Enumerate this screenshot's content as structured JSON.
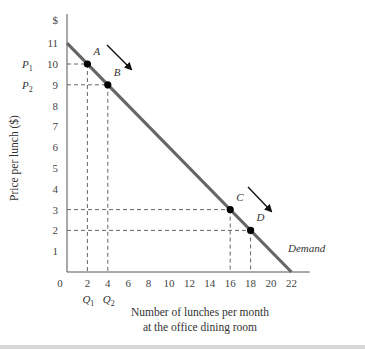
{
  "chart_data": {
    "type": "line",
    "title": "",
    "xlabel": "Number of lunches per month at the office dining room",
    "xlabel_lines": [
      "Number of lunches per month",
      "at the office dining room"
    ],
    "ylabel": "Price per lunch ($)",
    "y_unit_label": "$",
    "xlim": [
      0,
      22
    ],
    "ylim": [
      0,
      11
    ],
    "x_ticks": [
      0,
      2,
      4,
      6,
      8,
      10,
      12,
      14,
      16,
      18,
      20,
      22
    ],
    "y_ticks": [
      1,
      2,
      3,
      4,
      5,
      6,
      7,
      8,
      9,
      10,
      11
    ],
    "grid": false,
    "series": [
      {
        "name": "Demand",
        "x": [
          0,
          22
        ],
        "y": [
          11,
          0
        ],
        "color": "#666666"
      }
    ],
    "points": [
      {
        "label": "A",
        "x": 2,
        "y": 10
      },
      {
        "label": "B",
        "x": 4,
        "y": 9
      },
      {
        "label": "C",
        "x": 16,
        "y": 3
      },
      {
        "label": "D",
        "x": 18,
        "y": 2
      }
    ],
    "annotations": {
      "y_labels": [
        {
          "text": "P",
          "sub": "1",
          "y": 10
        },
        {
          "text": "P",
          "sub": "2",
          "y": 9
        }
      ],
      "x_labels": [
        {
          "text": "Q",
          "sub": "1",
          "x": 2
        },
        {
          "text": "Q",
          "sub": "2",
          "x": 4
        }
      ],
      "arrows": [
        {
          "from": "A",
          "to": "B",
          "direction": "down-right"
        },
        {
          "from": "C",
          "to": "D",
          "direction": "down-right"
        }
      ],
      "curve_label": "Demand"
    }
  }
}
